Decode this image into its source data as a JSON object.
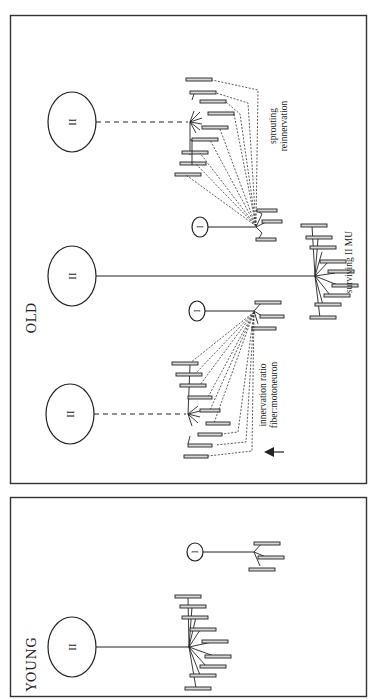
{
  "figure": {
    "orientation": "rotated 90 degrees counter-clockwise",
    "panels": [
      {
        "id": "old",
        "label": "OLD",
        "motor_units": [
          {
            "type": "II",
            "status": "denervated",
            "axon": "dashed",
            "fiber_count": 9
          },
          {
            "type": "I",
            "status": "sprouting",
            "axon": "solid",
            "fiber_count": 3
          },
          {
            "type": "II",
            "status": "surviving",
            "axon": "solid",
            "fiber_count": 9
          },
          {
            "type": "I",
            "status": "sprouting",
            "axon": "solid",
            "fiber_count": 3
          },
          {
            "type": "II",
            "status": "denervated",
            "axon": "dashed",
            "fiber_count": 9
          }
        ],
        "annotations": {
          "sprouting": "sprouting",
          "reinnervation": "reinnervation",
          "surviving": "surviving II MU",
          "innervation_ratio": "innervation ratio",
          "fiber_motoneuron": "fiber:motoneuron",
          "arrow": "up-arrow"
        }
      },
      {
        "id": "young",
        "label": "YOUNG",
        "motor_units": [
          {
            "type": "II",
            "status": "intact",
            "axon": "solid",
            "fiber_count": 9
          },
          {
            "type": "I",
            "status": "intact",
            "axon": "solid",
            "fiber_count": 3
          }
        ]
      }
    ],
    "soma_labels": {
      "type_two": "II",
      "type_one": "I"
    }
  }
}
